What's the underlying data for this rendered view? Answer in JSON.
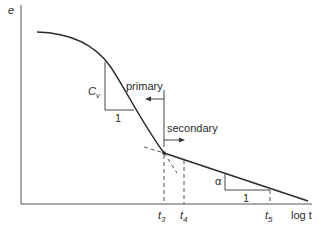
{
  "diagram": {
    "y_axis_label": "e",
    "x_axis_label": "log t",
    "slope_labels": {
      "primary_slope": "C",
      "primary_slope_sub": "v",
      "primary_run": "1",
      "secondary_slope": "α",
      "secondary_run": "1"
    },
    "regions": {
      "primary": "primary",
      "secondary": "secondary"
    },
    "time_ticks": [
      {
        "base": "t",
        "sub": "3"
      },
      {
        "base": "t",
        "sub": "4"
      },
      {
        "base": "t",
        "sub": "5"
      }
    ],
    "colors": {
      "line": "#2a2a2a",
      "background": "#ffffff"
    }
  }
}
